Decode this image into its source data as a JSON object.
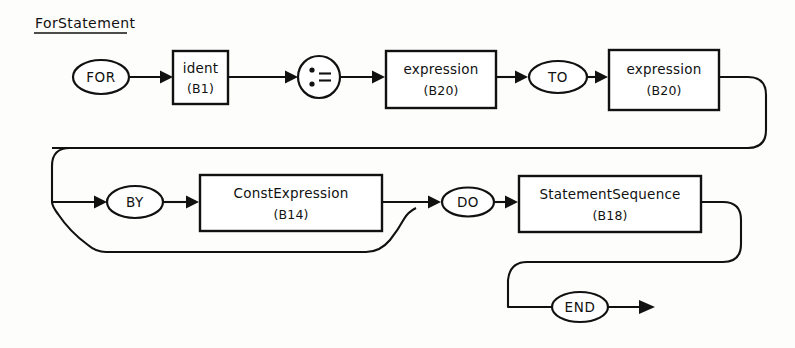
{
  "diagram": {
    "title": "ForStatement",
    "type": "railroad-syntax-diagram",
    "stroke_color": "#111111",
    "background_color": "#fdfdfb",
    "nodes": {
      "for_keyword": {
        "label": "FOR",
        "shape": "ellipse"
      },
      "ident": {
        "label": "ident",
        "ref": "(B1)",
        "shape": "box"
      },
      "assign": {
        "label": ":=",
        "shape": "circle"
      },
      "expression1": {
        "label": "expression",
        "ref": "(B20)",
        "shape": "box"
      },
      "to_keyword": {
        "label": "TO",
        "shape": "ellipse"
      },
      "expression2": {
        "label": "expression",
        "ref": "(B20)",
        "shape": "box"
      },
      "by_keyword": {
        "label": "BY",
        "shape": "ellipse"
      },
      "const_expression": {
        "label": "ConstExpression",
        "ref": "(B14)",
        "shape": "box"
      },
      "do_keyword": {
        "label": "DO",
        "shape": "ellipse"
      },
      "statement_sequence": {
        "label": "StatementSequence",
        "ref": "(B18)",
        "shape": "box"
      },
      "end_keyword": {
        "label": "END",
        "shape": "ellipse"
      }
    },
    "sequence": [
      "FOR",
      "ident (B1)",
      ":=",
      "expression (B20)",
      "TO",
      "expression (B20)",
      "BY",
      "ConstExpression (B14)",
      "DO",
      "StatementSequence (B18)",
      "END"
    ],
    "optional_branch": "BY ConstExpression (B14)"
  }
}
